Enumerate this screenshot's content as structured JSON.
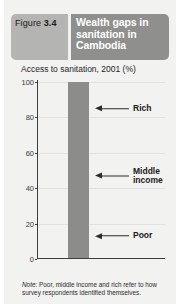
{
  "figure": {
    "tag_prefix": "Figure ",
    "tag_number": "3.4",
    "title": "Wealth gaps in sanitation in Cambodia"
  },
  "chart_panel": {
    "chart_title": "Access to sanitation, 2001 (%)"
  },
  "note": {
    "label": "Note:",
    "text": " Poor, middle income and rich refer to how survey respondents identified themselves."
  },
  "colors": {
    "page_background": "#f2f2f0",
    "figure_tag_background": "#b4b4b2",
    "title_background": "#8f8f8d",
    "title_text": "#ffffff",
    "bar_fill": "#8c8c8a",
    "axis": "#3d3d3d",
    "gridline": "#e2e2df"
  },
  "chart_data": {
    "type": "bar",
    "title": "Access to sanitation, 2001 (%)",
    "xlabel": "",
    "ylabel": "",
    "ylim": [
      0,
      100
    ],
    "yticks": [
      0,
      20,
      40,
      60,
      80,
      100
    ],
    "ytick_labels": [
      "0",
      "20",
      "40",
      "60",
      "80",
      "100"
    ],
    "grid": true,
    "legend_position": "none",
    "categories": [
      "Cambodia"
    ],
    "values": [
      100
    ],
    "annotations": [
      {
        "label": "Rich",
        "value": 85,
        "note": "arrow pointing to upper segment of bar"
      },
      {
        "label": "Middle\nincome",
        "value": 47,
        "note": "arrow pointing to middle segment of bar"
      },
      {
        "label": "Poor",
        "value": 13,
        "note": "arrow pointing to lower segment of bar"
      }
    ]
  }
}
